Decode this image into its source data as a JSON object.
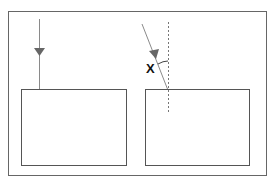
{
  "diagram": {
    "angle_label": "X",
    "colors": {
      "stroke": "#555555",
      "ray": "#8a8a8a",
      "arrow": "#666666",
      "normal": "#777777"
    }
  }
}
